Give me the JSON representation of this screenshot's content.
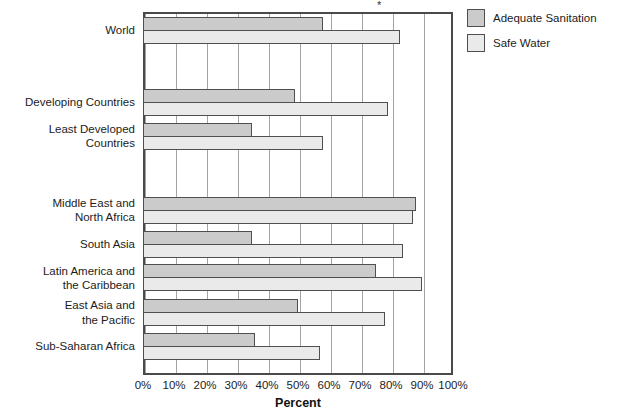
{
  "chart_data": {
    "type": "bar",
    "orientation": "horizontal",
    "title": "",
    "xlabel": "Percent",
    "xlim": [
      0,
      100
    ],
    "x_ticks": [
      "0%",
      "10%",
      "20%",
      "30%",
      "40%",
      "50%",
      "60%",
      "70%",
      "80%",
      "90%",
      "100%"
    ],
    "grid": "vertical",
    "legend_position": "top-right",
    "footnote_marker": "*",
    "categories": [
      "World",
      "Developing Countries",
      "Least Developed\nCountries",
      "Middle East and\nNorth Africa",
      "South Asia",
      "Latin America and\nthe Caribbean",
      "East Asia and\nthe Pacific",
      "Sub-Saharan Africa"
    ],
    "groups": [
      0,
      1,
      1,
      2,
      2,
      2,
      2,
      2
    ],
    "series": [
      {
        "name": "Adequate Sanitation",
        "color": "#cbcbcb",
        "values": [
          58,
          49,
          35,
          88,
          35,
          75,
          50,
          36
        ]
      },
      {
        "name": "Safe Water",
        "color": "#eaeaea",
        "values": [
          83,
          79,
          58,
          87,
          84,
          90,
          78,
          57
        ]
      }
    ]
  }
}
